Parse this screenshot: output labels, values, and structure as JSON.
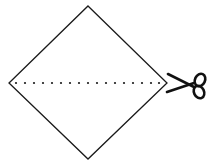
{
  "diagram": {
    "description": "Square paper rotated as a diamond, with a dotted fold/cut line across the horizontal diagonal and scissors at the right corner",
    "shape": {
      "type": "diamond",
      "vertices": {
        "top": [
          88,
          6
        ],
        "right": [
          167,
          83
        ],
        "bottom": [
          88,
          159
        ],
        "left": [
          9,
          83
        ]
      },
      "stroke": "#1a1a1a",
      "fill": "#ffffff",
      "stroke_width": 1.3
    },
    "cut_line": {
      "style": "dotted",
      "y": 83,
      "x_start": 16,
      "x_end": 159,
      "dot_count": 17,
      "color": "#1a1a1a"
    },
    "icon": {
      "name": "scissors-icon",
      "position": [
        184,
        84
      ],
      "color": "#111111"
    },
    "labels": []
  }
}
